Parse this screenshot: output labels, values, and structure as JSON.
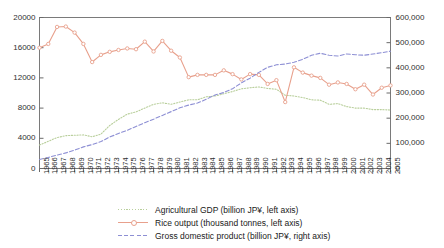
{
  "chart_data": {
    "type": "line",
    "title": "",
    "subtitle": "",
    "xlabel": "",
    "ylabel": "",
    "ylabel_right": "",
    "grid": false,
    "legend_position": "bottom",
    "x": [
      1965,
      1966,
      1967,
      1968,
      1969,
      1970,
      1971,
      1972,
      1973,
      1974,
      1975,
      1976,
      1977,
      1978,
      1979,
      1980,
      1981,
      1982,
      1983,
      1984,
      1985,
      1986,
      1987,
      1988,
      1989,
      1990,
      1991,
      1992,
      1993,
      1994,
      1995,
      1996,
      1997,
      1998,
      1999,
      2000,
      2001,
      2002,
      2003,
      2004,
      2005
    ],
    "xtick_labels": [
      "1965",
      "1966",
      "1967",
      "1968",
      "1969",
      "1970",
      "1971",
      "1972",
      "1973",
      "1974",
      "1975",
      "1976",
      "1977",
      "1978",
      "1979",
      "1980",
      "1981",
      "1982",
      "1983",
      "1984",
      "1985",
      "1986",
      "1987",
      "1988",
      "1989",
      "1990",
      "1991",
      "1992",
      "1993",
      "1994",
      "1995",
      "1996",
      "1997",
      "1998",
      "1999",
      "2000",
      "2001",
      "2002",
      "2003",
      "2004",
      "2005"
    ],
    "left_axis": {
      "min": 0,
      "max": 20000,
      "ticks": [
        0,
        4000,
        8000,
        12000,
        16000,
        20000
      ],
      "tick_labels": [
        "0",
        "4000",
        "8000",
        "12000",
        "16000",
        "20000"
      ]
    },
    "right_axis": {
      "min": 0,
      "max": 600000,
      "ticks": [
        0,
        100000,
        200000,
        300000,
        400000,
        500000,
        600000
      ],
      "tick_labels": [
        "0",
        "100,000",
        "200,000",
        "300,000",
        "400,000",
        "500,000",
        "600,000"
      ]
    },
    "series": [
      {
        "name": "Agricultural GDP (billion JP¥, left axis)",
        "axis": "left",
        "color": "#b9cf9c",
        "marker": "none",
        "dash": "dotted",
        "values": [
          3100,
          3600,
          4100,
          4350,
          4400,
          4450,
          4200,
          4550,
          5700,
          6500,
          7200,
          7500,
          8000,
          8500,
          8700,
          8500,
          8800,
          9100,
          9100,
          9500,
          9600,
          9900,
          10200,
          10550,
          10700,
          10800,
          10600,
          10500,
          9700,
          9600,
          9400,
          9100,
          9050,
          8500,
          8600,
          8200,
          8000,
          8000,
          7800,
          7800,
          7750
        ]
      },
      {
        "name": "Rice output (thousand tonnes, left axis)",
        "axis": "left",
        "color": "#e8a08c",
        "marker": "circle",
        "dash": "solid",
        "values": [
          16000,
          16500,
          18750,
          18800,
          18000,
          16500,
          14100,
          15050,
          15450,
          15700,
          15900,
          15800,
          16800,
          15500,
          16900,
          15600,
          14700,
          12100,
          12400,
          12400,
          12400,
          13000,
          12500,
          11800,
          12500,
          12400,
          11200,
          11700,
          8800,
          13400,
          12700,
          12300,
          12000,
          11100,
          11400,
          11200,
          10500,
          11100,
          9800,
          10700,
          11000
        ]
      },
      {
        "name": "Gross domestic product (billion JP¥, right axis)",
        "axis": "right",
        "color": "#8d8fd4",
        "marker": "none",
        "dash": "dashed",
        "values": [
          36000,
          44000,
          53000,
          62000,
          73000,
          86000,
          95000,
          107000,
          125000,
          139000,
          152000,
          167000,
          182000,
          196000,
          211000,
          226000,
          241000,
          252000,
          260000,
          275000,
          292000,
          302000,
          317000,
          340000,
          359000,
          382000,
          402000,
          412000,
          415000,
          422000,
          434000,
          450000,
          458000,
          450000,
          447000,
          455000,
          452000,
          450000,
          455000,
          460000,
          466000
        ]
      }
    ]
  },
  "legend": {
    "items": [
      {
        "label": "Agricultural GDP (billion JP¥, left axis)"
      },
      {
        "label": "Rice output (thousand tonnes, left axis)"
      },
      {
        "label": "Gross domestic product (billion JP¥, right axis)"
      }
    ]
  }
}
